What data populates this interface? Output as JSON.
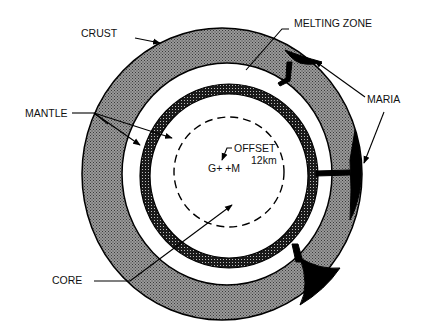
{
  "diagram": {
    "type": "cross-section",
    "labels": {
      "crust": "CRUST",
      "melting_zone": "MELTING ZONE",
      "maria": "MARIA",
      "mantle": "MANTLE",
      "offset": "OFFSET",
      "offset_value": "12km",
      "centers": "G+ +M",
      "core": "CORE"
    },
    "colors": {
      "line": "#000000",
      "crust_fill": "#8a8a8a",
      "melt_fill": "#1e1e1e",
      "maria_fill": "#000000",
      "background": "#ffffff"
    }
  }
}
